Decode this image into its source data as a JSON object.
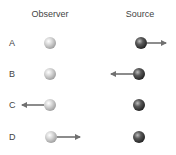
{
  "headers": {
    "observer": "Observer",
    "source": "Source"
  },
  "colors": {
    "observer_ball": "#c8c8c8",
    "source_ball": "#4a4a4a",
    "arrow": "#707070"
  },
  "rows": [
    {
      "label": "A",
      "observer_arrow": "none",
      "source_arrow": "right"
    },
    {
      "label": "B",
      "observer_arrow": "none",
      "source_arrow": "left"
    },
    {
      "label": "C",
      "observer_arrow": "left",
      "source_arrow": "none"
    },
    {
      "label": "D",
      "observer_arrow": "right",
      "source_arrow": "none"
    }
  ]
}
